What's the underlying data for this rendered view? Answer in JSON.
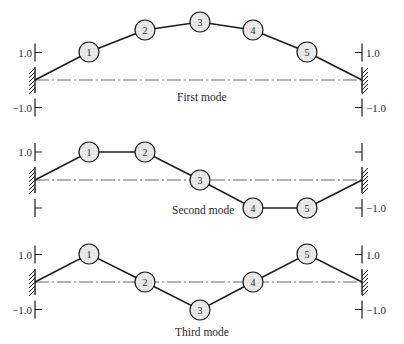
{
  "figure": {
    "colors": {
      "line": "#1a1a1a",
      "node_fill": "#e6e6e6",
      "node_stroke": "#1a1a1a",
      "baseline": "#555555",
      "text": "#2a2a2a"
    },
    "modes": [
      {
        "label": "First mode",
        "baseline_y": 80,
        "unit_px": 27.5,
        "label_pos": [
          177,
          101
        ],
        "left_ticks": {
          "top_label": "1.0",
          "bottom_label": "−1.0"
        },
        "right_ticks": {
          "top_label": "1.0",
          "bottom_label": "−1.0"
        },
        "amplitudes": [
          1.0,
          1.8,
          2.1,
          1.8,
          1.0
        ],
        "nodes": [
          {
            "id": "1",
            "x": 89,
            "y": 52
          },
          {
            "id": "2",
            "x": 145,
            "y": 30
          },
          {
            "id": "3",
            "x": 200,
            "y": 22
          },
          {
            "id": "4",
            "x": 253,
            "y": 30
          },
          {
            "id": "5",
            "x": 307,
            "y": 52
          }
        ]
      },
      {
        "label": "Second mode",
        "baseline_y": 180,
        "unit_px": 28,
        "label_pos": [
          172,
          214
        ],
        "left_ticks": {
          "top_label": "1.0",
          "bottom_label": ""
        },
        "right_ticks": {
          "top_label": "",
          "bottom_label": "−1.0"
        },
        "amplitudes": [
          1.0,
          1.0,
          0.0,
          -1.0,
          -1.0
        ],
        "nodes": [
          {
            "id": "1",
            "x": 89,
            "y": 152
          },
          {
            "id": "2",
            "x": 145,
            "y": 152
          },
          {
            "id": "3",
            "x": 200,
            "y": 180
          },
          {
            "id": "4",
            "x": 253,
            "y": 208
          },
          {
            "id": "5",
            "x": 307,
            "y": 208
          }
        ]
      },
      {
        "label": "Third mode",
        "baseline_y": 282,
        "unit_px": 27.5,
        "label_pos": [
          175,
          336
        ],
        "left_ticks": {
          "top_label": "1.0",
          "bottom_label": "−1.0"
        },
        "right_ticks": {
          "top_label": "1.0",
          "bottom_label": "−1.0"
        },
        "amplitudes": [
          1.0,
          0.0,
          -1.0,
          0.0,
          1.0
        ],
        "nodes": [
          {
            "id": "1",
            "x": 89,
            "y": 254
          },
          {
            "id": "2",
            "x": 145,
            "y": 282
          },
          {
            "id": "3",
            "x": 200,
            "y": 310
          },
          {
            "id": "4",
            "x": 253,
            "y": 282
          },
          {
            "id": "5",
            "x": 307,
            "y": 254
          }
        ]
      }
    ],
    "supports": {
      "left_x": 35,
      "right_x": 362
    },
    "node_radius": 10
  }
}
